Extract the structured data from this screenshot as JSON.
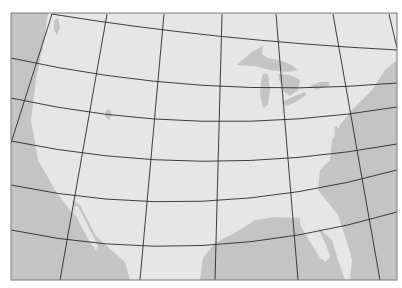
{
  "map": {
    "projection": "conic",
    "region": "contiguous United States",
    "frame": {
      "x": 11,
      "y": 13,
      "width": 386,
      "height": 267
    },
    "colors": {
      "background": "#ffffff",
      "land": "#e6e6e6",
      "water": "#c4c4c4",
      "graticule": "#2a2a2a",
      "frame": "#7a7a7a"
    },
    "graticule": {
      "parallels": [
        "M52 14 Q210 40 397 50",
        "M11 58 Q200 100 397 83",
        "M11 98 Q200 140 397 107",
        "M11 141 Q200 180 397 144",
        "M11 185 Q200 225 397 170",
        "M11 230 Q200 270 397 212"
      ],
      "meridians": [
        "M52 14 L11 143",
        "M107 14 L60 280",
        "M164 14 L140 280",
        "M222 14 L215 280",
        "M276 14 L298 280",
        "M333 14 L380 280",
        "M389 14 L397 48"
      ]
    },
    "water_features": [
      {
        "name": "pacific-ocean",
        "path": "M11 13 L48 13 L44 40 L36 80 L31 120 L38 160 L55 190 L70 210 L100 240 L125 262 L130 280 L11 280 Z"
      },
      {
        "name": "gulf-of-california",
        "path": "M72 200 L80 205 L98 240 L102 252 L96 250 L84 228 L74 210 Z"
      },
      {
        "name": "gulf-of-mexico",
        "path": "M200 280 L203 258 L215 243 L240 230 L255 220 L275 217 L300 218 L315 225 L332 240 L338 260 L345 280 Z"
      },
      {
        "name": "atlantic-ocean",
        "path": "M397 60 L385 70 L372 90 L352 110 L340 125 L332 140 L330 160 L320 170 L318 190 L338 215 L348 245 L352 260 L350 280 L397 280 Z"
      },
      {
        "name": "lake-superior",
        "path": "M237 65 L252 52 L263 46 L262 54 L268 58 L278 60 L290 64 L298 70 L287 72 L270 70 L255 66 Z"
      },
      {
        "name": "lake-michigan",
        "path": "M263 74 L268 74 L270 90 L268 105 L263 108 L260 95 L261 82 Z"
      },
      {
        "name": "lake-huron",
        "path": "M278 74 L290 75 L300 80 L298 90 L290 96 L284 92 L280 82 Z"
      },
      {
        "name": "lake-erie",
        "path": "M282 102 L295 96 L305 92 L306 95 L296 102 L286 106 Z"
      },
      {
        "name": "lake-ontario",
        "path": "M310 86 L320 82 L330 82 L328 86 L316 90 Z"
      },
      {
        "name": "puget-sound",
        "path": "M54 20 L58 18 L60 28 L57 35 L54 30 Z"
      },
      {
        "name": "great-salt-lake",
        "path": "M106 110 L110 109 L112 115 L109 120 L105 117 Z"
      },
      {
        "name": "chesapeake-bay",
        "path": "M334 128 L337 126 L340 134 L338 142 L335 138 Z"
      }
    ],
    "land_features": [
      {
        "name": "florida-peninsula",
        "path": "M300 218 L312 220 L318 228 L326 245 L330 256 L326 262 L320 258 L310 242 L300 225 Z"
      },
      {
        "name": "baja-california",
        "path": "M74 207 L78 206 L98 246 L96 250 L90 242 L78 220 Z"
      }
    ]
  }
}
